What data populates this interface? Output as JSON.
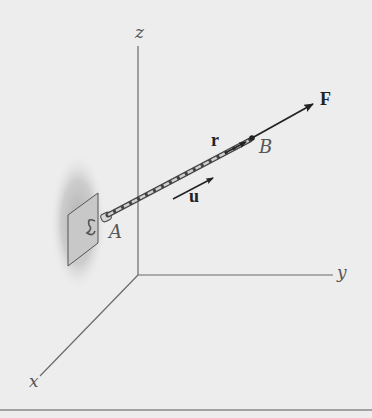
{
  "figure": {
    "type": "3d-force-vector-diagram",
    "axes": {
      "z_label": "z",
      "y_label": "y",
      "x_label": "x"
    },
    "points": {
      "A_label": "A",
      "B_label": "B"
    },
    "vectors": {
      "force_label": "F",
      "position_label": "r",
      "unit_label": "u"
    },
    "colors": {
      "background": "#ededed",
      "axis": "#6a6a6a",
      "vector": "#222222",
      "plate": "#c8c8c8",
      "shadow": "#b8b8b8"
    }
  }
}
